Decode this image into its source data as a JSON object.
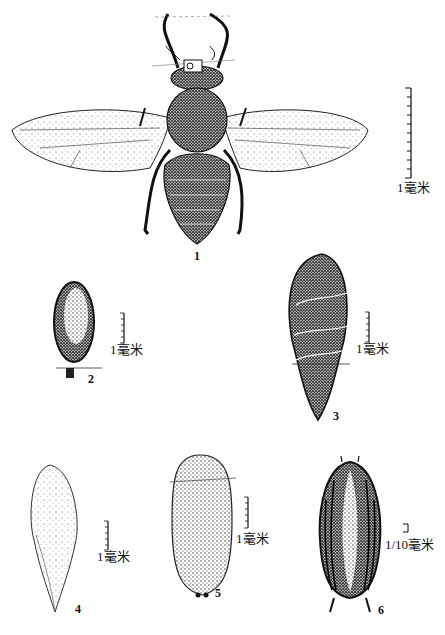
{
  "figure": {
    "type": "scientific illustration plate",
    "panels": [
      {
        "id": "1",
        "label": "1",
        "depicts": "adult fly, dorsal view with wings spread",
        "scale_label": "1毫米"
      },
      {
        "id": "2",
        "label": "2",
        "depicts": "small hairy oval body (egg)",
        "scale_label": "1毫米"
      },
      {
        "id": "3",
        "label": "3",
        "depicts": "stippled teardrop-shaped body with segment bands",
        "scale_label": "1毫米"
      },
      {
        "id": "4",
        "label": "4",
        "depicts": "elongate pale dotted egg-like body",
        "scale_label": "1毫米"
      },
      {
        "id": "5",
        "label": "5",
        "depicts": "oblong stippled puparium",
        "scale_label": "1毫米"
      },
      {
        "id": "6",
        "label": "6",
        "depicts": "dark ridged larva/pupa, dorsal view",
        "scale_label": "1/10毫米"
      }
    ],
    "caption": ""
  }
}
